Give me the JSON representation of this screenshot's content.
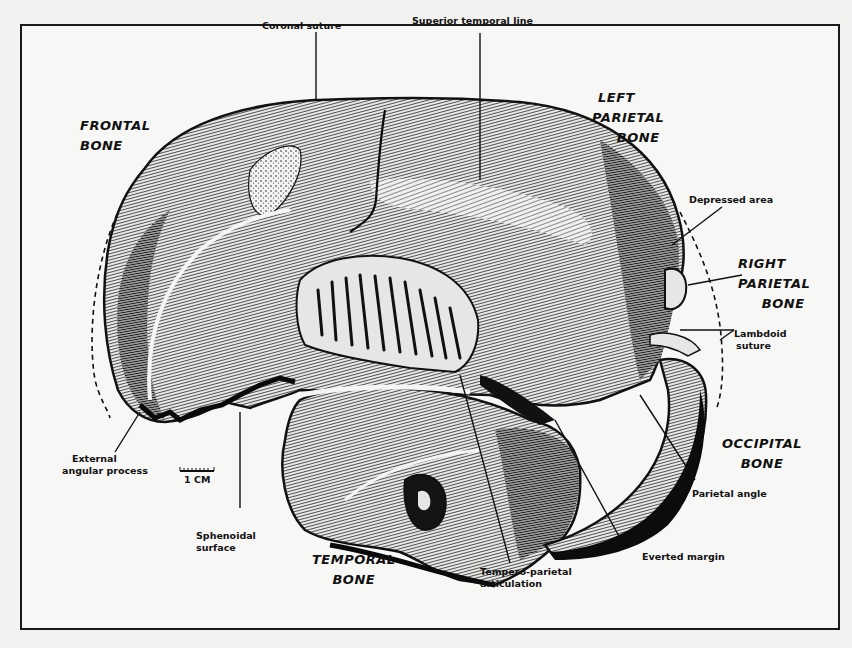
{
  "figure": {
    "bone_labels": {
      "frontal": [
        "FRONTAL",
        "BONE"
      ],
      "left_parietal": [
        "LEFT",
        "PARIETAL",
        "BONE"
      ],
      "right_parietal": [
        "RIGHT",
        "PARIETAL",
        "BONE"
      ],
      "occipital": [
        "OCCIPITAL",
        "BONE"
      ],
      "temporal": [
        "TEMPORAL",
        "BONE"
      ]
    },
    "annotations": {
      "coronal_suture": "Coronal suture",
      "superior_temporal_line": "Superior temporal line",
      "depressed_area": "Depressed area",
      "lambdoid_suture": [
        "Lambdoid",
        "suture"
      ],
      "parietal_angle": "Parietal angle",
      "everted_margin": "Everted margin",
      "tempero_parietal_articulation": [
        "Tempero-parietal",
        "articulation"
      ],
      "sphenoidal_surface": [
        "Sphenoidal",
        "surface"
      ],
      "external_angular_process": [
        "External",
        "angular process"
      ]
    },
    "scale_bar": {
      "label": "1 CM"
    },
    "colors": {
      "ink": "#111111",
      "paper": "#f7f7f5",
      "shade_dark": "#2a2a2a",
      "shade_mid": "#6a6a6a",
      "shade_light": "#b8b8b8"
    }
  }
}
